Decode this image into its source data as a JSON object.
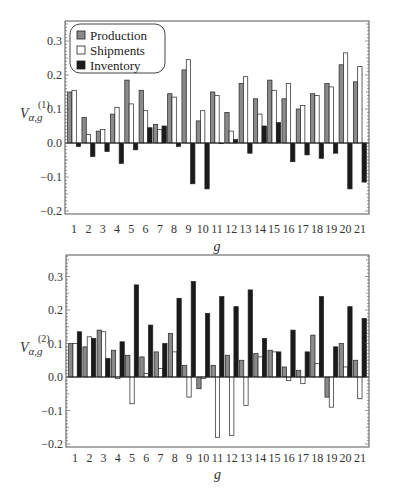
{
  "colors": {
    "production": "#8a8a8a",
    "shipments": "#ffffff",
    "inventory": "#1a1a1a",
    "frame": "#555555",
    "bar_stroke": "#222222"
  },
  "legend": {
    "items": [
      {
        "label": "Production",
        "color": "#8a8a8a"
      },
      {
        "label": "Shipments",
        "color": "#ffffff"
      },
      {
        "label": "Inventory",
        "color": "#1a1a1a"
      }
    ]
  },
  "chart_data": [
    {
      "type": "bar",
      "title": "",
      "xlabel": "g",
      "ylabel": "V_{α,g}^{(1)}",
      "ylabel_main": "V",
      "ylabel_sub": "α,g",
      "ylabel_sup": "(1)",
      "ylim": [
        -0.21,
        0.36
      ],
      "yticks": [
        -0.2,
        -0.1,
        0.0,
        0.1,
        0.2,
        0.3
      ],
      "ytick_labels": [
        "−0.2",
        "−0.1",
        "0.0",
        "0.1",
        "0.2",
        "0.3"
      ],
      "grid": false,
      "legend_position": "upper left",
      "categories": [
        "1",
        "2",
        "3",
        "4",
        "5",
        "6",
        "7",
        "8",
        "9",
        "10",
        "11",
        "12",
        "13",
        "14",
        "15",
        "16",
        "17",
        "18",
        "19",
        "20",
        "21"
      ],
      "series": [
        {
          "name": "Production",
          "values": [
            0.15,
            0.075,
            0.035,
            0.085,
            0.185,
            0.155,
            0.055,
            0.145,
            0.215,
            0.065,
            0.15,
            0.09,
            0.175,
            0.13,
            0.185,
            0.13,
            0.1,
            0.145,
            0.175,
            0.23,
            0.18
          ]
        },
        {
          "name": "Shipments",
          "values": [
            0.155,
            0.025,
            0.04,
            0.105,
            0.115,
            0.095,
            0.04,
            0.135,
            0.245,
            0.095,
            0.14,
            0.035,
            0.195,
            0.085,
            0.155,
            0.175,
            0.11,
            0.14,
            0.165,
            0.265,
            0.225
          ]
        },
        {
          "name": "Inventory",
          "values": [
            -0.01,
            -0.04,
            -0.025,
            -0.06,
            -0.02,
            0.045,
            0.05,
            -0.01,
            -0.12,
            -0.135,
            -0.002,
            0.01,
            -0.03,
            0.05,
            0.06,
            -0.055,
            -0.035,
            -0.045,
            -0.03,
            -0.135,
            -0.115
          ]
        }
      ]
    },
    {
      "type": "bar",
      "title": "",
      "xlabel": "g",
      "ylabel": "V_{α,g}^{(2)}",
      "ylabel_main": "V",
      "ylabel_sub": "α,g",
      "ylabel_sup": "(2)",
      "ylim": [
        -0.21,
        0.36
      ],
      "yticks": [
        -0.2,
        -0.1,
        0.0,
        0.1,
        0.2,
        0.3
      ],
      "ytick_labels": [
        "−0.2",
        "−0.1",
        "0.0",
        "0.1",
        "0.2",
        "0.3"
      ],
      "grid": false,
      "legend_position": "none",
      "categories": [
        "1",
        "2",
        "3",
        "4",
        "5",
        "6",
        "7",
        "8",
        "9",
        "10",
        "11",
        "12",
        "13",
        "14",
        "15",
        "16",
        "17",
        "18",
        "19",
        "20",
        "21"
      ],
      "series": [
        {
          "name": "Production",
          "values": [
            0.1,
            0.09,
            0.14,
            0.08,
            0.065,
            0.06,
            0.075,
            0.13,
            0.035,
            -0.035,
            0.035,
            0.065,
            0.05,
            0.07,
            0.08,
            0.03,
            0.02,
            0.125,
            -0.06,
            0.1,
            0.05
          ]
        },
        {
          "name": "Shipments",
          "values": [
            0.1,
            0.12,
            0.135,
            -0.005,
            -0.08,
            0.01,
            0.025,
            0.075,
            -0.06,
            -0.005,
            -0.18,
            -0.175,
            -0.085,
            0.06,
            0.075,
            -0.01,
            -0.02,
            0.04,
            -0.09,
            0.03,
            -0.065
          ]
        },
        {
          "name": "Inventory",
          "values": [
            0.135,
            0.115,
            0.055,
            0.105,
            0.275,
            0.155,
            0.1,
            0.235,
            0.285,
            0.19,
            0.24,
            0.21,
            0.26,
            0.115,
            0.075,
            0.14,
            0.075,
            0.24,
            0.09,
            0.21,
            0.175
          ]
        }
      ]
    }
  ]
}
